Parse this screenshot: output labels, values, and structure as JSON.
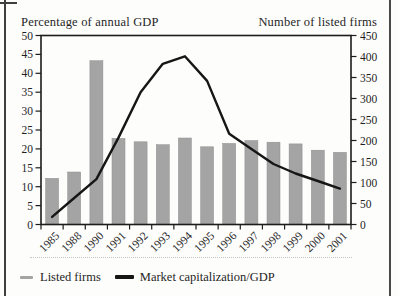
{
  "figure": {
    "left_axis_title": "Percentage of annual GDP",
    "right_axis_title": "Number of listed firms"
  },
  "legend": {
    "bars_label": "Listed firms",
    "line_label": "Market capitalization/GDP"
  },
  "colors": {
    "bar": "#a4a4a4",
    "bar_edge": "#8f8f8f",
    "line": "#161616",
    "axis": "#1c1c1c",
    "text": "#1f1f1f"
  },
  "chart_data": {
    "type": "bar",
    "categories": [
      "1985",
      "1988",
      "1990",
      "1991",
      "1992",
      "1993",
      "1994",
      "1995",
      "1996",
      "1997",
      "1998",
      "1999",
      "2000",
      "2001"
    ],
    "series": [
      {
        "name": "Listed firms",
        "type": "bar",
        "axis": "right",
        "values": [
          110,
          125,
          390,
          205,
          197,
          190,
          206,
          185,
          193,
          200,
          196,
          192,
          177,
          172
        ]
      },
      {
        "name": "Market capitalization/GDP",
        "type": "line",
        "axis": "left",
        "values": [
          2,
          7,
          12,
          23,
          35,
          42.5,
          44.5,
          38,
          24,
          20,
          16,
          13.5,
          11.5,
          9.5
        ]
      }
    ],
    "left_axis": {
      "title": "Percentage of annual GDP",
      "min": 0,
      "max": 50,
      "step": 5
    },
    "right_axis": {
      "title": "Number of listed firms",
      "min": 0,
      "max": 450,
      "step": 50
    },
    "grid": false,
    "legend_position": "bottom-left"
  }
}
